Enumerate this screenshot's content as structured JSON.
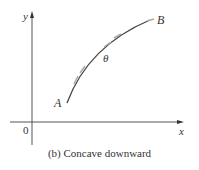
{
  "figure": {
    "caption": "(b) Concave downward",
    "labels": {
      "y_axis": "y",
      "x_axis": "x",
      "origin": "0",
      "point_a": "A",
      "point_b": "B",
      "angle": "θ"
    },
    "colors": {
      "axis": "#555555",
      "curve": "#444444",
      "tangent": "#999999",
      "text": "#333333"
    },
    "curve": {
      "type": "concave-downward",
      "start": "A",
      "end": "B"
    }
  }
}
